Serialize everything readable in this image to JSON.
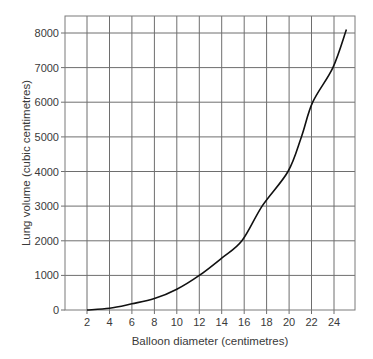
{
  "chart_data": {
    "type": "line",
    "title": "",
    "xlabel": "Balloon diameter (centimetres)",
    "ylabel": "Lung volume (cubic centimetres)",
    "xlim": [
      0,
      26
    ],
    "ylim": [
      0,
      8300
    ],
    "x_ticks": [
      2,
      4,
      6,
      8,
      10,
      12,
      14,
      16,
      18,
      20,
      22,
      24
    ],
    "y_ticks": [
      0,
      1000,
      2000,
      3000,
      4000,
      5000,
      6000,
      7000,
      8000
    ],
    "grid": true,
    "legend": null,
    "series": [
      {
        "name": "Lung volume",
        "x": [
          2,
          4,
          6,
          8,
          10,
          12,
          14,
          15.8,
          17.6,
          19.9,
          21.1,
          22.1,
          23.9,
          25.1
        ],
        "values": [
          0,
          50,
          180,
          330,
          600,
          1000,
          1500,
          2000,
          3000,
          4000,
          5000,
          6000,
          7000,
          8100
        ]
      }
    ],
    "colors": {
      "line": "#111111",
      "grid": "#6e6e6e",
      "text": "#3a3a3a"
    }
  }
}
